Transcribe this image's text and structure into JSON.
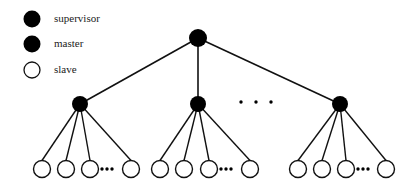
{
  "legend": [
    {
      "label": "supervisor",
      "type": "filled",
      "cx": 32,
      "cy": 19
    },
    {
      "label": "master",
      "type": "filled",
      "cx": 32,
      "cy": 44
    },
    {
      "label": "slave",
      "type": "hollow",
      "cx": 32,
      "cy": 70
    }
  ],
  "tree": {
    "supervisor": {
      "cx": 198,
      "cy": 38,
      "r": 9
    },
    "masters": [
      {
        "cx": 80,
        "cy": 104,
        "r": 8,
        "slaves_x": [
          42,
          66,
          90,
          131
        ],
        "dots_x": 107
      },
      {
        "cx": 198,
        "cy": 104,
        "r": 8,
        "slaves_x": [
          160,
          184,
          209,
          250
        ],
        "dots_x": 226
      },
      {
        "cx": 340,
        "cy": 104,
        "r": 8,
        "slaves_x": [
          298,
          322,
          346,
          386
        ],
        "dots_x": 363
      }
    ],
    "slave_y": 169,
    "slave_r": 8.5,
    "mid_ellipsis": {
      "x": [
        241,
        256,
        271
      ],
      "y": 102
    }
  },
  "colors": {
    "stroke": "#111111",
    "fill": "#000000",
    "background": "#ffffff"
  }
}
